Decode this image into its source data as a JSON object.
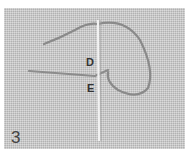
{
  "image": {
    "description": "Embroidery stitch instruction photo on evenweave fabric showing a needle and thread loop",
    "labels": {
      "d": "D",
      "e": "E"
    },
    "step_number": "3",
    "colors": {
      "fabric": "#c9c9c9",
      "thread": "#8a8a8a",
      "needle": "#e8e8e8"
    }
  }
}
